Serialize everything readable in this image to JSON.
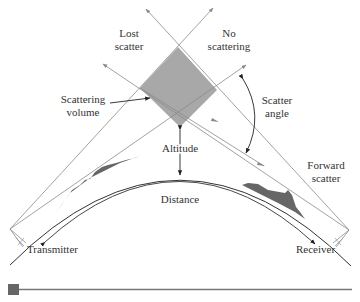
{
  "diagram": {
    "labels": {
      "lost_scatter_1": "Lost",
      "lost_scatter_2": "scatter",
      "no_scattering_1": "No",
      "no_scattering_2": "scattering",
      "scattering_volume_1": "Scattering",
      "scattering_volume_2": "volume",
      "scatter_angle_1": "Scatter",
      "scatter_angle_2": "angle",
      "altitude": "Altitude",
      "forward_scatter_1": "Forward",
      "forward_scatter_2": "scatter",
      "distance": "Distance",
      "transmitter": "Transmitter",
      "receiver": "Receiver"
    },
    "colors": {
      "line": "#8a8a8a",
      "dark_line": "#333333",
      "volume_fill": "#a8a8a8",
      "terrain_fill": "#666666",
      "bar": "#777777",
      "bar_square": "#666666"
    }
  }
}
